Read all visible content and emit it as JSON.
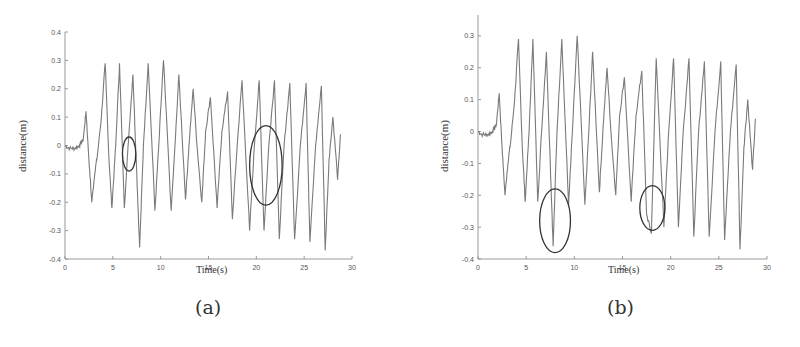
{
  "chart_data": [
    {
      "type": "line",
      "panel_label": "(a)",
      "title": "",
      "xlabel": "Time(s)",
      "ylabel": "distance(m)",
      "xlim": [
        0,
        30
      ],
      "ylim": [
        -0.4,
        0.4
      ],
      "xticks": [
        0,
        5,
        10,
        15,
        20,
        25,
        30
      ],
      "yticks": [
        0.4,
        0.3,
        0.2,
        0.1,
        0,
        -0.1,
        -0.2,
        -0.3,
        -0.4
      ],
      "ytick_labels": [
        "0.4",
        "0.3",
        "0.2",
        "0.1",
        "0",
        "-0.1",
        "-0.2",
        "-0.3",
        "-0.4"
      ],
      "grid": false,
      "line_color": "#7a7a7a",
      "series": [
        {
          "name": "distance",
          "x": [
            0,
            0.5,
            1,
            1.5,
            1.9,
            2.2,
            2.5,
            2.8,
            3.1,
            3.4,
            3.8,
            4.2,
            4.6,
            4.9,
            5.3,
            5.7,
            6.2,
            6.6,
            7.1,
            7.5,
            7.8,
            8.2,
            8.7,
            9.4,
            9.8,
            10.3,
            11.1,
            11.5,
            11.9,
            12.6,
            13.0,
            13.4,
            13.8,
            14.3,
            14.7,
            15.2,
            15.9,
            16.4,
            17.0,
            17.5,
            18.0,
            18.5,
            19.3,
            19.8,
            20.3,
            20.8,
            21.3,
            21.9,
            22.4,
            22.9,
            23.5,
            24.0,
            24.6,
            25.2,
            25.6,
            26.2,
            26.8,
            27.2,
            27.6,
            28.0,
            28.5,
            28.8
          ],
          "y": [
            0,
            -0.01,
            -0.01,
            0,
            0.02,
            0.12,
            -0.05,
            -0.2,
            -0.1,
            -0.03,
            0.1,
            0.29,
            -0.05,
            -0.22,
            0.0,
            0.29,
            -0.22,
            0.0,
            0.25,
            -0.1,
            -0.36,
            0.0,
            0.29,
            -0.23,
            0.0,
            0.3,
            -0.23,
            0.0,
            0.25,
            -0.19,
            0.02,
            0.2,
            0.0,
            -0.2,
            0.05,
            0.17,
            -0.22,
            0.05,
            0.19,
            -0.26,
            0.0,
            0.23,
            -0.3,
            0.0,
            0.23,
            -0.3,
            0.0,
            0.23,
            -0.33,
            0.0,
            0.22,
            -0.33,
            0.0,
            0.22,
            -0.34,
            0.0,
            0.21,
            -0.37,
            -0.05,
            0.1,
            -0.12,
            0.04
          ]
        }
      ],
      "annotations": [
        {
          "shape": "ellipse",
          "cx_time": 6.7,
          "cy_distance": -0.03,
          "rx_time": 0.7,
          "ry_distance": 0.06
        },
        {
          "shape": "ellipse",
          "cx_time": 21.0,
          "cy_distance": -0.07,
          "rx_time": 1.7,
          "ry_distance": 0.14
        }
      ]
    },
    {
      "type": "line",
      "panel_label": "(b)",
      "title": "",
      "xlabel": "Time(s)",
      "ylabel": "distance(m)",
      "xlim": [
        0,
        30
      ],
      "ylim": [
        -0.4,
        0.4
      ],
      "xticks": [
        0,
        5,
        10,
        15,
        20,
        25,
        30
      ],
      "yticks": [
        0.3,
        0.2,
        0.1,
        0,
        -0.1,
        -0.2,
        -0.3,
        -0.4
      ],
      "ytick_labels": [
        "0.3",
        "0.2",
        "0.1",
        "0",
        "-0.1",
        "-0.2",
        "-0.3",
        "-0.4"
      ],
      "grid": false,
      "line_color": "#7a7a7a",
      "series": [
        {
          "name": "distance",
          "x": [
            0,
            0.5,
            1,
            1.5,
            1.9,
            2.2,
            2.5,
            2.8,
            3.1,
            3.4,
            3.8,
            4.2,
            4.6,
            4.9,
            5.3,
            5.7,
            6.2,
            6.6,
            7.1,
            7.5,
            7.8,
            8.2,
            8.7,
            9.4,
            9.8,
            10.3,
            11.1,
            11.5,
            11.9,
            12.6,
            13.0,
            13.4,
            13.8,
            14.3,
            14.7,
            15.2,
            15.9,
            16.4,
            17.0,
            17.5,
            18.0,
            18.5,
            19.3,
            19.8,
            20.3,
            20.8,
            21.3,
            21.9,
            22.4,
            22.9,
            23.5,
            24.0,
            24.6,
            25.2,
            25.6,
            26.2,
            26.8,
            27.2,
            27.6,
            28.0,
            28.5,
            28.8
          ],
          "y": [
            0,
            -0.01,
            -0.01,
            0,
            0.02,
            0.12,
            -0.05,
            -0.2,
            -0.1,
            -0.03,
            0.1,
            0.29,
            -0.05,
            -0.22,
            0.0,
            0.29,
            -0.22,
            0.0,
            0.25,
            -0.1,
            -0.36,
            0.0,
            0.29,
            -0.23,
            0.0,
            0.3,
            -0.23,
            0.0,
            0.25,
            -0.19,
            0.02,
            0.2,
            0.0,
            -0.2,
            0.05,
            0.17,
            -0.22,
            0.05,
            0.19,
            -0.26,
            -0.32,
            0.23,
            -0.3,
            0.0,
            0.23,
            -0.3,
            0.0,
            0.23,
            -0.33,
            0.0,
            0.22,
            -0.33,
            0.0,
            0.22,
            -0.34,
            0.0,
            0.21,
            -0.37,
            -0.05,
            0.1,
            -0.12,
            0.04
          ]
        }
      ],
      "annotations": [
        {
          "shape": "ellipse",
          "cx_time": 8.0,
          "cy_distance": -0.28,
          "rx_time": 1.6,
          "ry_distance": 0.1
        },
        {
          "shape": "ellipse",
          "cx_time": 18.1,
          "cy_distance": -0.24,
          "rx_time": 1.3,
          "ry_distance": 0.07
        }
      ]
    }
  ]
}
